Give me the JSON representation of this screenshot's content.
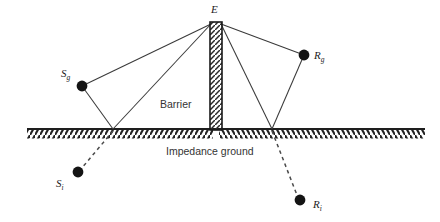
{
  "figure": {
    "type": "diagram",
    "background_color": "#ffffff",
    "line_color": "#3a3a3a",
    "node_color": "#1a1a1a",
    "width": 440,
    "height": 222
  },
  "labels": {
    "edge": {
      "base": "E",
      "sub": ""
    },
    "source_ground": {
      "base": "S",
      "sub": "g"
    },
    "receiver_ground": {
      "base": "R",
      "sub": "g"
    },
    "source_image": {
      "base": "S",
      "sub": "i"
    },
    "receiver_image": {
      "base": "R",
      "sub": "i"
    },
    "barrier": "Barrier",
    "ground": "Impedance ground"
  },
  "geometry": {
    "ground_line": {
      "x1": 27,
      "x2": 425,
      "y": 129
    },
    "barrier": {
      "x_left": 210,
      "x_right": 222,
      "y_top": 22,
      "y_bottom": 130
    },
    "nodes": [
      {
        "name": "E",
        "x": 216,
        "y": 22,
        "radius": 0
      },
      {
        "name": "S_g",
        "x": 82,
        "y": 86,
        "radius": 5.4
      },
      {
        "name": "R_g",
        "x": 304,
        "y": 55,
        "radius": 5.4
      },
      {
        "name": "S_i",
        "x": 78,
        "y": 172,
        "radius": 5.4
      },
      {
        "name": "R_i",
        "x": 300,
        "y": 200,
        "radius": 5.4
      }
    ],
    "reflection_points": [
      {
        "name": "left-reflection",
        "x": 113,
        "y": 129
      },
      {
        "name": "right-reflection",
        "x": 272,
        "y": 129
      }
    ],
    "solid_rays": [
      {
        "name": "ray-source-to-edge",
        "x1": 82,
        "y1": 86,
        "x2": 211,
        "y2": 23
      },
      {
        "name": "ray-source-to-ground",
        "x1": 82,
        "y1": 86,
        "x2": 113,
        "y2": 129
      },
      {
        "name": "ray-ground-to-edge",
        "x1": 113,
        "y1": 129,
        "x2": 211,
        "y2": 23
      },
      {
        "name": "ray-edge-to-ground-right",
        "x1": 221,
        "y1": 23,
        "x2": 272,
        "y2": 129
      },
      {
        "name": "ray-ground-to-receiver",
        "x1": 272,
        "y1": 129,
        "x2": 304,
        "y2": 55
      },
      {
        "name": "ray-edge-to-receiver",
        "x1": 221,
        "y1": 23,
        "x2": 304,
        "y2": 55
      }
    ],
    "dashed_rays": [
      {
        "name": "dashed-source-image",
        "x1": 113,
        "y1": 131,
        "x2": 81,
        "y2": 169
      },
      {
        "name": "dashed-receiver-image",
        "x1": 272,
        "y1": 131,
        "x2": 297,
        "y2": 196
      }
    ]
  }
}
